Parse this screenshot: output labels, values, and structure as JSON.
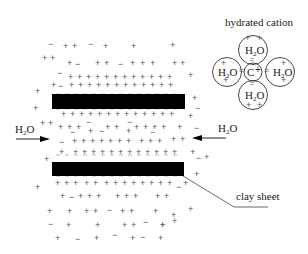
{
  "diagram": {
    "title": "",
    "labels": {
      "hydrated_cation": "hydrated cation",
      "clay_sheet": "clay sheet",
      "water_left": "H2O",
      "water_right": "H2O"
    },
    "cation": {
      "center_symbol": "C",
      "center_charge": "+",
      "ligand": "H2O",
      "ligand_count": 4,
      "bond": "="
    },
    "colors": {
      "sheet": "#000000",
      "charge": "#555555",
      "line": "#333333",
      "background": "#ffffff"
    },
    "sheets": [
      {
        "name": "top-clay-sheet",
        "x": 52,
        "y": 94,
        "w": 133,
        "h": 15
      },
      {
        "name": "bottom-clay-sheet",
        "x": 52,
        "y": 162,
        "w": 132,
        "h": 14
      }
    ],
    "charges": [
      {
        "s": "−",
        "x": 48,
        "y": 47
      },
      {
        "s": "+",
        "x": 63,
        "y": 49
      },
      {
        "s": "+",
        "x": 72,
        "y": 49
      },
      {
        "s": "−",
        "x": 88,
        "y": 47
      },
      {
        "s": "+",
        "x": 103,
        "y": 49
      },
      {
        "s": "+",
        "x": 131,
        "y": 49
      },
      {
        "s": "+",
        "x": 170,
        "y": 48
      },
      {
        "s": "+",
        "x": 42,
        "y": 61
      },
      {
        "s": "+",
        "x": 50,
        "y": 61
      },
      {
        "s": "+",
        "x": 67,
        "y": 66
      },
      {
        "s": "−",
        "x": 75,
        "y": 67
      },
      {
        "s": "+",
        "x": 95,
        "y": 66
      },
      {
        "s": "+",
        "x": 104,
        "y": 66
      },
      {
        "s": "−",
        "x": 118,
        "y": 67
      },
      {
        "s": "+",
        "x": 130,
        "y": 66
      },
      {
        "s": "+",
        "x": 140,
        "y": 66
      },
      {
        "s": "+",
        "x": 150,
        "y": 66
      },
      {
        "s": "+",
        "x": 172,
        "y": 66
      },
      {
        "s": "+",
        "x": 180,
        "y": 66
      },
      {
        "s": "−",
        "x": 57,
        "y": 76
      },
      {
        "s": "+",
        "x": 68,
        "y": 80
      },
      {
        "s": "+",
        "x": 77,
        "y": 80
      },
      {
        "s": "+",
        "x": 86,
        "y": 80
      },
      {
        "s": "+",
        "x": 95,
        "y": 80
      },
      {
        "s": "+",
        "x": 104,
        "y": 80
      },
      {
        "s": "+",
        "x": 113,
        "y": 80
      },
      {
        "s": "+",
        "x": 122,
        "y": 80
      },
      {
        "s": "+",
        "x": 131,
        "y": 80
      },
      {
        "s": "+",
        "x": 140,
        "y": 80
      },
      {
        "s": "+",
        "x": 149,
        "y": 80
      },
      {
        "s": "+",
        "x": 158,
        "y": 80
      },
      {
        "s": "+",
        "x": 167,
        "y": 80
      },
      {
        "s": "+",
        "x": 188,
        "y": 78
      },
      {
        "s": "+",
        "x": 51,
        "y": 88
      },
      {
        "s": "−",
        "x": 58,
        "y": 89
      },
      {
        "s": "+",
        "x": 69,
        "y": 88
      },
      {
        "s": "+",
        "x": 78,
        "y": 88
      },
      {
        "s": "+",
        "x": 87,
        "y": 88
      },
      {
        "s": "+",
        "x": 96,
        "y": 88
      },
      {
        "s": "+",
        "x": 105,
        "y": 88
      },
      {
        "s": "+",
        "x": 114,
        "y": 88
      },
      {
        "s": "+",
        "x": 123,
        "y": 88
      },
      {
        "s": "+",
        "x": 132,
        "y": 88
      },
      {
        "s": "+",
        "x": 141,
        "y": 88
      },
      {
        "s": "+",
        "x": 150,
        "y": 88
      },
      {
        "s": "+",
        "x": 159,
        "y": 88
      },
      {
        "s": "+",
        "x": 168,
        "y": 88
      },
      {
        "s": "+",
        "x": 35,
        "y": 94
      },
      {
        "s": "+",
        "x": 192,
        "y": 101
      },
      {
        "s": "−",
        "x": 195,
        "y": 111
      },
      {
        "s": "+",
        "x": 33,
        "y": 111
      },
      {
        "s": "+",
        "x": 61,
        "y": 117
      },
      {
        "s": "+",
        "x": 70,
        "y": 117
      },
      {
        "s": "+",
        "x": 79,
        "y": 117
      },
      {
        "s": "+",
        "x": 88,
        "y": 117
      },
      {
        "s": "+",
        "x": 97,
        "y": 117
      },
      {
        "s": "+",
        "x": 106,
        "y": 117
      },
      {
        "s": "+",
        "x": 115,
        "y": 117
      },
      {
        "s": "+",
        "x": 124,
        "y": 117
      },
      {
        "s": "+",
        "x": 133,
        "y": 117
      },
      {
        "s": "+",
        "x": 142,
        "y": 117
      },
      {
        "s": "+",
        "x": 151,
        "y": 117
      },
      {
        "s": "+",
        "x": 160,
        "y": 117
      },
      {
        "s": "+",
        "x": 169,
        "y": 117
      },
      {
        "s": "+",
        "x": 188,
        "y": 119
      },
      {
        "s": "+",
        "x": 40,
        "y": 126
      },
      {
        "s": "+",
        "x": 48,
        "y": 126
      },
      {
        "s": "+",
        "x": 58,
        "y": 130
      },
      {
        "s": "+",
        "x": 67,
        "y": 130
      },
      {
        "s": "+",
        "x": 76,
        "y": 130
      },
      {
        "s": "−",
        "x": 86,
        "y": 125
      },
      {
        "s": "+",
        "x": 105,
        "y": 130
      },
      {
        "s": "+",
        "x": 114,
        "y": 130
      },
      {
        "s": "−",
        "x": 127,
        "y": 125
      },
      {
        "s": "+",
        "x": 134,
        "y": 130
      },
      {
        "s": "+",
        "x": 143,
        "y": 130
      },
      {
        "s": "+",
        "x": 152,
        "y": 130
      },
      {
        "s": "+",
        "x": 161,
        "y": 130
      },
      {
        "s": "+",
        "x": 177,
        "y": 130
      },
      {
        "s": "−",
        "x": 70,
        "y": 135
      },
      {
        "s": "+",
        "x": 88,
        "y": 134
      },
      {
        "s": "−",
        "x": 99,
        "y": 134
      },
      {
        "s": "+",
        "x": 126,
        "y": 134
      },
      {
        "s": "−",
        "x": 150,
        "y": 135
      },
      {
        "s": "−",
        "x": 194,
        "y": 131
      },
      {
        "s": "−",
        "x": 59,
        "y": 145
      },
      {
        "s": "+",
        "x": 72,
        "y": 144
      },
      {
        "s": "+",
        "x": 81,
        "y": 144
      },
      {
        "s": "+",
        "x": 90,
        "y": 144
      },
      {
        "s": "+",
        "x": 99,
        "y": 144
      },
      {
        "s": "+",
        "x": 108,
        "y": 144
      },
      {
        "s": "+",
        "x": 117,
        "y": 144
      },
      {
        "s": "+",
        "x": 126,
        "y": 144
      },
      {
        "s": "+",
        "x": 139,
        "y": 144
      },
      {
        "s": "+",
        "x": 148,
        "y": 144
      },
      {
        "s": "+",
        "x": 157,
        "y": 144
      },
      {
        "s": "+",
        "x": 171,
        "y": 142
      },
      {
        "s": "+",
        "x": 180,
        "y": 142
      },
      {
        "s": "+",
        "x": 59,
        "y": 155
      },
      {
        "s": "+",
        "x": 73,
        "y": 155
      },
      {
        "s": "+",
        "x": 82,
        "y": 155
      },
      {
        "s": "+",
        "x": 91,
        "y": 155
      },
      {
        "s": "+",
        "x": 100,
        "y": 155
      },
      {
        "s": "+",
        "x": 109,
        "y": 155
      },
      {
        "s": "+",
        "x": 118,
        "y": 155
      },
      {
        "s": "+",
        "x": 127,
        "y": 155
      },
      {
        "s": "+",
        "x": 136,
        "y": 155
      },
      {
        "s": "+",
        "x": 145,
        "y": 155
      },
      {
        "s": "+",
        "x": 154,
        "y": 155
      },
      {
        "s": "+",
        "x": 163,
        "y": 155
      },
      {
        "s": "+",
        "x": 172,
        "y": 155
      },
      {
        "s": "+",
        "x": 190,
        "y": 155
      },
      {
        "s": "+",
        "x": 44,
        "y": 162
      },
      {
        "s": "−",
        "x": 196,
        "y": 161
      },
      {
        "s": "+",
        "x": 204,
        "y": 160
      },
      {
        "s": "+",
        "x": 194,
        "y": 177
      },
      {
        "s": "+",
        "x": 55,
        "y": 186
      },
      {
        "s": "+",
        "x": 64,
        "y": 186
      },
      {
        "s": "+",
        "x": 73,
        "y": 186
      },
      {
        "s": "+",
        "x": 84,
        "y": 186
      },
      {
        "s": "+",
        "x": 93,
        "y": 186
      },
      {
        "s": "+",
        "x": 104,
        "y": 186
      },
      {
        "s": "+",
        "x": 113,
        "y": 186
      },
      {
        "s": "+",
        "x": 122,
        "y": 186
      },
      {
        "s": "+",
        "x": 131,
        "y": 186
      },
      {
        "s": "+",
        "x": 140,
        "y": 186
      },
      {
        "s": "+",
        "x": 149,
        "y": 186
      },
      {
        "s": "+",
        "x": 158,
        "y": 186
      },
      {
        "s": "+",
        "x": 167,
        "y": 186
      },
      {
        "s": "+",
        "x": 183,
        "y": 186
      },
      {
        "s": "+",
        "x": 35,
        "y": 190
      },
      {
        "s": "−",
        "x": 176,
        "y": 190
      },
      {
        "s": "+",
        "x": 60,
        "y": 199
      },
      {
        "s": "−",
        "x": 69,
        "y": 200
      },
      {
        "s": "+",
        "x": 78,
        "y": 199
      },
      {
        "s": "+",
        "x": 87,
        "y": 199
      },
      {
        "s": "+",
        "x": 96,
        "y": 199
      },
      {
        "s": "+",
        "x": 115,
        "y": 199
      },
      {
        "s": "+",
        "x": 124,
        "y": 199
      },
      {
        "s": "+",
        "x": 133,
        "y": 199
      },
      {
        "s": "+",
        "x": 155,
        "y": 199
      },
      {
        "s": "+",
        "x": 164,
        "y": 199
      },
      {
        "s": "+",
        "x": 47,
        "y": 214
      },
      {
        "s": "+",
        "x": 67,
        "y": 214
      },
      {
        "s": "+",
        "x": 84,
        "y": 214
      },
      {
        "s": "+",
        "x": 93,
        "y": 214
      },
      {
        "s": "−",
        "x": 107,
        "y": 213
      },
      {
        "s": "+",
        "x": 120,
        "y": 214
      },
      {
        "s": "+",
        "x": 129,
        "y": 214
      },
      {
        "s": "+",
        "x": 153,
        "y": 214
      },
      {
        "s": "+",
        "x": 188,
        "y": 212
      },
      {
        "s": "+",
        "x": 171,
        "y": 218
      },
      {
        "s": "−",
        "x": 48,
        "y": 227
      },
      {
        "s": "+",
        "x": 66,
        "y": 228
      },
      {
        "s": "+",
        "x": 95,
        "y": 228
      },
      {
        "s": "+",
        "x": 122,
        "y": 228
      },
      {
        "s": "+",
        "x": 131,
        "y": 228
      },
      {
        "s": "−",
        "x": 143,
        "y": 225
      },
      {
        "s": "+",
        "x": 160,
        "y": 228
      },
      {
        "s": "+",
        "x": 172,
        "y": 224
      },
      {
        "s": "+",
        "x": 160,
        "y": 228
      },
      {
        "s": "−",
        "x": 112,
        "y": 238
      },
      {
        "s": "+",
        "x": 55,
        "y": 241
      },
      {
        "s": "−",
        "x": 75,
        "y": 242
      },
      {
        "s": "+",
        "x": 94,
        "y": 241
      },
      {
        "s": "+",
        "x": 130,
        "y": 241
      },
      {
        "s": "−",
        "x": 140,
        "y": 240
      },
      {
        "s": "+",
        "x": 158,
        "y": 241
      }
    ],
    "sheet_surface_minus_y": [
      97,
      112,
      158,
      179
    ]
  }
}
